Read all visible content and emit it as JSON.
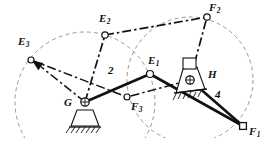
{
  "figure": {
    "type": "kinematic-linkage-diagram",
    "background": "#ffffff",
    "stroke_color": "#111111",
    "dashed_color": "#8a8a8a"
  },
  "labels": {
    "E1": {
      "base": "E",
      "sub": "1",
      "x": 148,
      "y": 55
    },
    "E2": {
      "base": "E",
      "sub": "2",
      "x": 99,
      "y": 13
    },
    "E3": {
      "base": "E",
      "sub": "3",
      "x": 18,
      "y": 36
    },
    "F1": {
      "base": "F",
      "sub": "1",
      "x": 249,
      "y": 127
    },
    "F2": {
      "base": "F",
      "sub": "2",
      "x": 209,
      "y": 3
    },
    "F3": {
      "base": "F",
      "sub": "3",
      "x": 131,
      "y": 101
    },
    "G": {
      "base": "G",
      "sub": "",
      "x": 64,
      "y": 97
    },
    "H": {
      "base": "H",
      "sub": "",
      "x": 208,
      "y": 70
    }
  },
  "link_numbers": {
    "link2": {
      "text": "2",
      "x": 108,
      "y": 65
    },
    "link4": {
      "text": "4",
      "x": 215,
      "y": 90
    }
  },
  "joints": {
    "E1": {
      "x": 150,
      "y": 74,
      "shape": "circle"
    },
    "E2": {
      "x": 105,
      "y": 35,
      "shape": "circle"
    },
    "E3": {
      "x": 31,
      "y": 60,
      "shape": "circle"
    },
    "F1": {
      "x": 243,
      "y": 126,
      "shape": "square"
    },
    "F2": {
      "x": 207,
      "y": 17,
      "shape": "circle"
    },
    "F3": {
      "x": 127,
      "y": 97,
      "shape": "circle"
    },
    "G": {
      "x": 85,
      "y": 102,
      "shape": "ground-pivot"
    },
    "H": {
      "x": 190,
      "y": 80,
      "shape": "ground-pivot"
    }
  },
  "arcs": {
    "E_path": {
      "cx": 85,
      "cy": 102,
      "r": 70,
      "label": "circular path of point E about pivot G"
    },
    "F_path": {
      "cx": 190,
      "cy": 80,
      "r": 63,
      "label": "circular path of point F about pivot H"
    }
  },
  "solid_links": [
    {
      "name": "link-2-G-E1",
      "from": "G",
      "to": "E1"
    },
    {
      "name": "link-3-E1-F1",
      "from": "E1",
      "to": "F1"
    },
    {
      "name": "link-4-H-F1",
      "from": "H",
      "to": "F1"
    }
  ],
  "dashdot_links": [
    {
      "name": "position-2-G-E2",
      "from": "G",
      "to": "E2"
    },
    {
      "name": "position-2-E2-F2",
      "from": "E2",
      "to": "F2"
    },
    {
      "name": "position-2-H-F2",
      "from": "H",
      "to": "F2"
    },
    {
      "name": "position-3-G-E3",
      "from": "G",
      "to": "E3"
    },
    {
      "name": "position-3-E3-F3",
      "from": "E3",
      "to": "F3"
    },
    {
      "name": "position-3-H-F3",
      "from": "H",
      "to": "F3"
    }
  ],
  "arrows": [
    {
      "name": "arrow-to-E3",
      "from": "G",
      "to": "E3"
    }
  ]
}
